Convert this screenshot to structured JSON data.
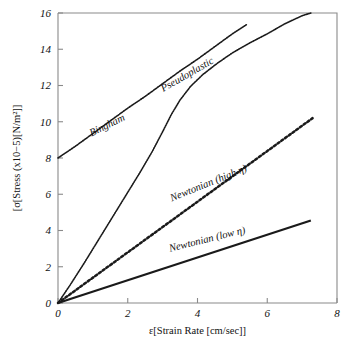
{
  "figure": {
    "background_color": "#ffffff",
    "ink_color": "#1a1a1a",
    "axis_color": "#8a8a8a"
  },
  "chart_data": {
    "type": "line",
    "title": "",
    "xlabel": "ε[Strain Rate [cm/sec]]",
    "ylabel": "[σ[Stress (x10−5)[N/m²]]",
    "xlim": [
      0,
      8
    ],
    "ylim": [
      0,
      16
    ],
    "xticks": [
      0,
      2,
      4,
      6,
      8
    ],
    "xtick_labels": [
      "0",
      "2",
      "4",
      "6",
      "8"
    ],
    "yticks": [
      0,
      2,
      4,
      6,
      8,
      10,
      12,
      14,
      16
    ],
    "ytick_labels": [
      "0",
      "2",
      "4",
      "6",
      "8",
      "10",
      "12",
      "14",
      "16"
    ],
    "grid": false,
    "legend": "inline-annotations",
    "series": [
      {
        "name": "Bingham",
        "label": "Bingham",
        "style": "dotted-fine",
        "stroke_width": 1.6,
        "dash": "1.3 1.0",
        "label_x": 1.45,
        "label_y": 9.65,
        "label_rotation": -26,
        "points": [
          [
            0.0,
            8.0
          ],
          [
            0.5,
            8.65
          ],
          [
            1.0,
            9.35
          ],
          [
            1.5,
            10.05
          ],
          [
            2.0,
            10.75
          ],
          [
            2.5,
            11.4
          ],
          [
            3.0,
            12.1
          ],
          [
            3.5,
            12.8
          ],
          [
            4.0,
            13.45
          ],
          [
            4.5,
            14.15
          ],
          [
            5.0,
            14.85
          ],
          [
            5.4,
            15.35
          ]
        ]
      },
      {
        "name": "Pseudoplastic",
        "label": "Pseudoplastic",
        "style": "dotted-fine",
        "stroke_width": 1.6,
        "dash": "1.3 1.0",
        "label_x": 3.75,
        "label_y": 12.45,
        "label_rotation": -30,
        "points": [
          [
            0.0,
            0.0
          ],
          [
            0.35,
            1.0
          ],
          [
            0.75,
            2.2
          ],
          [
            1.15,
            3.45
          ],
          [
            1.55,
            4.7
          ],
          [
            1.95,
            5.95
          ],
          [
            2.35,
            7.2
          ],
          [
            2.7,
            8.35
          ],
          [
            3.0,
            9.45
          ],
          [
            3.25,
            10.4
          ],
          [
            3.5,
            11.2
          ],
          [
            3.8,
            11.95
          ],
          [
            4.15,
            12.6
          ],
          [
            4.55,
            13.2
          ],
          [
            5.0,
            13.8
          ],
          [
            5.5,
            14.35
          ],
          [
            6.0,
            14.85
          ],
          [
            6.5,
            15.4
          ],
          [
            7.0,
            15.85
          ],
          [
            7.25,
            16.0
          ]
        ]
      },
      {
        "name": "Newtonian (high η)",
        "label": "Newtonian (high η)",
        "style": "dotted-coarse",
        "stroke_width": 2.5,
        "dash": "2.2 2.4",
        "label_x": 4.35,
        "label_y": 6.45,
        "label_rotation": -22,
        "points": [
          [
            0.0,
            0.0
          ],
          [
            7.3,
            10.2
          ]
        ]
      },
      {
        "name": "Newtonian (low η)",
        "label": "Newtonian (low η)",
        "style": "solid",
        "stroke_width": 2.3,
        "dash": "",
        "label_x": 4.3,
        "label_y": 3.35,
        "label_rotation": -14,
        "points": [
          [
            0.0,
            0.0
          ],
          [
            7.25,
            4.55
          ]
        ]
      }
    ]
  }
}
